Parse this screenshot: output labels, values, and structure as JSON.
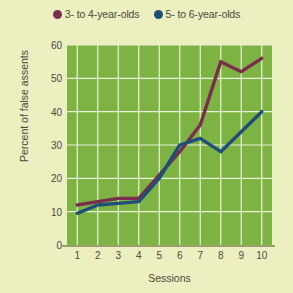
{
  "chart_data": {
    "type": "line",
    "title": "",
    "xlabel": "Sessions",
    "ylabel": "Percent of false assents",
    "x": [
      1,
      2,
      3,
      4,
      5,
      6,
      7,
      8,
      9,
      10
    ],
    "xticklabels": [
      "1",
      "2",
      "3",
      "4",
      "5",
      "6",
      "7",
      "8",
      "9",
      "10"
    ],
    "yticks": [
      0,
      10,
      20,
      30,
      40,
      50,
      60
    ],
    "yticklabels": [
      "0",
      "10",
      "20",
      "30",
      "40",
      "50",
      "60"
    ],
    "xlim": [
      0.5,
      10.5
    ],
    "ylim": [
      0,
      60
    ],
    "grid": true,
    "legend_position": "top-center",
    "series": [
      {
        "name": "3- to 4-year-olds",
        "color": "#7B2D4E",
        "values": [
          12,
          13,
          14,
          14,
          21,
          28,
          36,
          55,
          52,
          56
        ]
      },
      {
        "name": "5- to 6-year-olds",
        "color": "#1F4E79",
        "values": [
          9.5,
          12,
          12.5,
          13,
          20,
          30,
          32,
          28,
          34,
          40
        ]
      }
    ]
  },
  "legend": {
    "entries": [
      {
        "label": "3- to 4-year-olds",
        "color": "#7B2D4E"
      },
      {
        "label": "5- to 6-year-olds",
        "color": "#1F4E79"
      }
    ]
  },
  "axes": {
    "y_title": "Percent of false assents",
    "x_title": "Sessions"
  },
  "colors": {
    "background": "#ECEFC0",
    "plot_background": "#7CB342",
    "gridline": "#E8F2D8",
    "text": "#4a4a3c",
    "series_1": "#7B2D4E",
    "series_2": "#1F4E79"
  }
}
